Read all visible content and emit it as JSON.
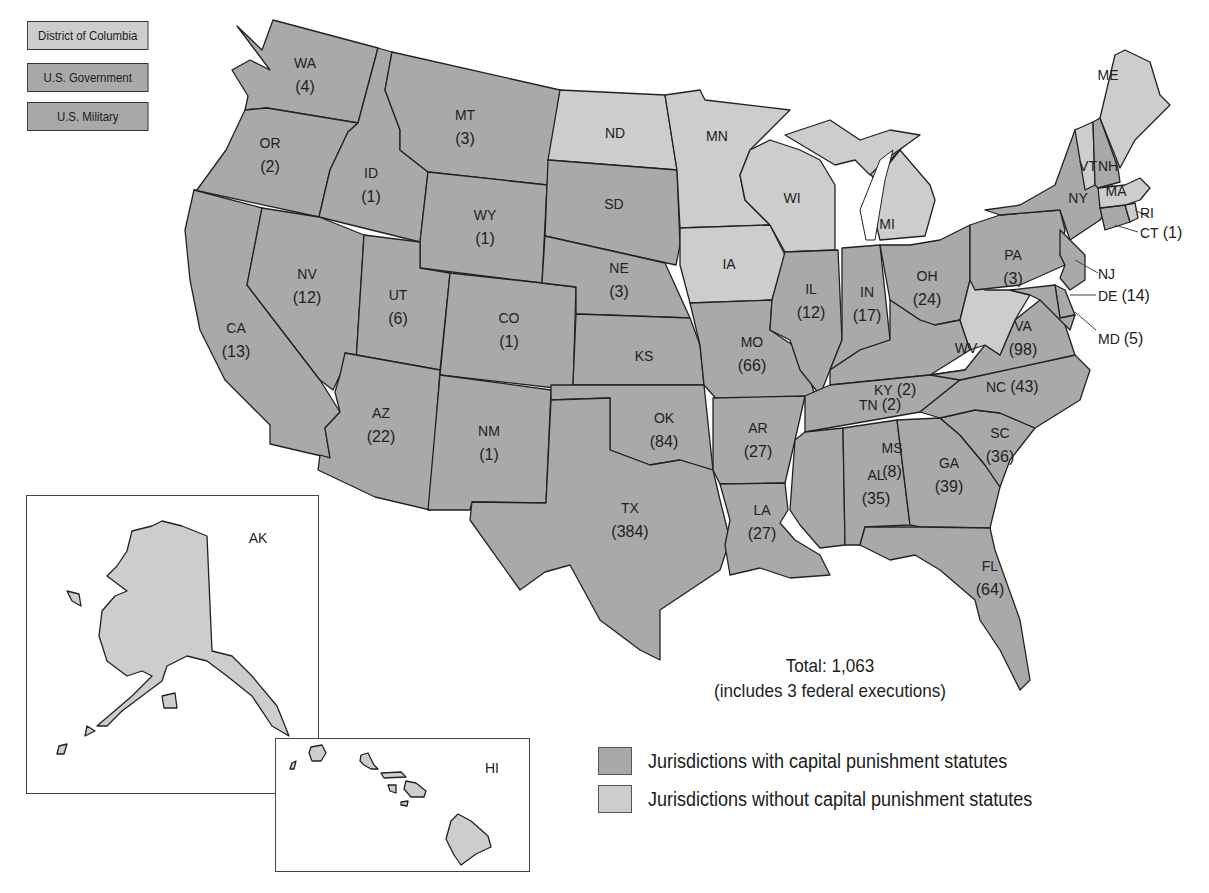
{
  "colors": {
    "with_statutes": "#a9a9a9",
    "without_statutes": "#cdcdcd",
    "border": "#222222",
    "background": "#ffffff"
  },
  "jurisdiction_boxes": [
    {
      "label": "District of Columbia",
      "status": "without"
    },
    {
      "label": "U.S. Government",
      "status": "with"
    },
    {
      "label": "U.S. Military",
      "status": "with"
    }
  ],
  "states": {
    "WA": {
      "abbr": "WA",
      "count": "(4)",
      "status": "with"
    },
    "OR": {
      "abbr": "OR",
      "count": "(2)",
      "status": "with"
    },
    "CA": {
      "abbr": "CA",
      "count": "(13)",
      "status": "with"
    },
    "ID": {
      "abbr": "ID",
      "count": "(1)",
      "status": "with"
    },
    "NV": {
      "abbr": "NV",
      "count": "(12)",
      "status": "with"
    },
    "MT": {
      "abbr": "MT",
      "count": "(3)",
      "status": "with"
    },
    "WY": {
      "abbr": "WY",
      "count": "(1)",
      "status": "with"
    },
    "UT": {
      "abbr": "UT",
      "count": "(6)",
      "status": "with"
    },
    "AZ": {
      "abbr": "AZ",
      "count": "(22)",
      "status": "with"
    },
    "CO": {
      "abbr": "CO",
      "count": "(1)",
      "status": "with"
    },
    "NM": {
      "abbr": "NM",
      "count": "(1)",
      "status": "with"
    },
    "ND": {
      "abbr": "ND",
      "count": "",
      "status": "without"
    },
    "SD": {
      "abbr": "SD",
      "count": "",
      "status": "with"
    },
    "NE": {
      "abbr": "NE",
      "count": "(3)",
      "status": "with"
    },
    "KS": {
      "abbr": "KS",
      "count": "",
      "status": "with"
    },
    "OK": {
      "abbr": "OK",
      "count": "(84)",
      "status": "with"
    },
    "TX": {
      "abbr": "TX",
      "count": "(384)",
      "status": "with"
    },
    "MN": {
      "abbr": "MN",
      "count": "",
      "status": "without"
    },
    "IA": {
      "abbr": "IA",
      "count": "",
      "status": "without"
    },
    "MO": {
      "abbr": "MO",
      "count": "(66)",
      "status": "with"
    },
    "AR": {
      "abbr": "AR",
      "count": "(27)",
      "status": "with"
    },
    "LA": {
      "abbr": "LA",
      "count": "(27)",
      "status": "with"
    },
    "WI": {
      "abbr": "WI",
      "count": "",
      "status": "without"
    },
    "IL": {
      "abbr": "IL",
      "count": "(12)",
      "status": "with"
    },
    "MI": {
      "abbr": "MI",
      "count": "",
      "status": "without"
    },
    "IN": {
      "abbr": "IN",
      "count": "(17)",
      "status": "with"
    },
    "OH": {
      "abbr": "OH",
      "count": "(24)",
      "status": "with"
    },
    "KY": {
      "abbr": "KY",
      "count": "(2)",
      "status": "with"
    },
    "TN": {
      "abbr": "TN",
      "count": "(2)",
      "status": "with"
    },
    "MS": {
      "abbr": "MS",
      "count": "(8)",
      "status": "with"
    },
    "AL": {
      "abbr": "AL",
      "count": "(35)",
      "status": "with"
    },
    "GA": {
      "abbr": "GA",
      "count": "(39)",
      "status": "with"
    },
    "FL": {
      "abbr": "FL",
      "count": "(64)",
      "status": "with"
    },
    "SC": {
      "abbr": "SC",
      "count": "(36)",
      "status": "with"
    },
    "NC": {
      "abbr": "NC",
      "count": "(43)",
      "status": "with"
    },
    "VA": {
      "abbr": "VA",
      "count": "(98)",
      "status": "with"
    },
    "WV": {
      "abbr": "WV",
      "count": "",
      "status": "without"
    },
    "PA": {
      "abbr": "PA",
      "count": "(3)",
      "status": "with"
    },
    "NY": {
      "abbr": "NY",
      "count": "",
      "status": "with"
    },
    "NJ": {
      "abbr": "NJ",
      "count": "",
      "status": "with"
    },
    "DE": {
      "abbr": "DE",
      "count": "(14)",
      "status": "with"
    },
    "MD": {
      "abbr": "MD",
      "count": "(5)",
      "status": "with"
    },
    "CT": {
      "abbr": "CT",
      "count": "(1)",
      "status": "with"
    },
    "RI": {
      "abbr": "RI",
      "count": "",
      "status": "without"
    },
    "MA": {
      "abbr": "MA",
      "count": "",
      "status": "without"
    },
    "VT": {
      "abbr": "VT",
      "count": "",
      "status": "without"
    },
    "NH": {
      "abbr": "NH",
      "count": "",
      "status": "with"
    },
    "ME": {
      "abbr": "ME",
      "count": "",
      "status": "without"
    },
    "AK": {
      "abbr": "AK",
      "count": "",
      "status": "without"
    },
    "HI": {
      "abbr": "HI",
      "count": "",
      "status": "without"
    }
  },
  "total": {
    "line1": "Total: 1,063",
    "line2": "(includes 3 federal executions)"
  },
  "legend": [
    {
      "label": "Jurisdictions with capital punishment statutes",
      "color": "#a9a9a9"
    },
    {
      "label": "Jurisdictions without capital punishment statutes",
      "color": "#cdcdcd"
    }
  ]
}
